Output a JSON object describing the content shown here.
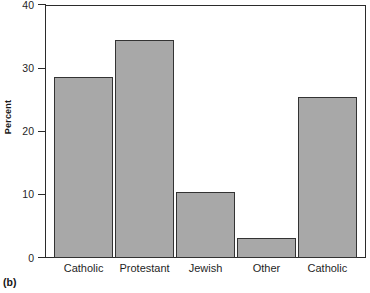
{
  "chart_data": {
    "type": "bar",
    "title": "",
    "subtitle": "",
    "xlabel": "",
    "ylabel": "Percent",
    "categories": [
      "Catholic",
      "Protestant",
      "Jewish",
      "Other",
      "Catholic"
    ],
    "values": [
      28.6,
      34.4,
      10.4,
      3.1,
      25.4
    ],
    "ylim": [
      0,
      40
    ],
    "yticks": [
      0,
      10,
      20,
      30,
      40
    ],
    "ytick_labels": [
      "0",
      "10",
      "20",
      "30",
      "40"
    ],
    "xticks": [],
    "grid": false,
    "legend": null,
    "legend_position": "none",
    "annotations": [
      "(b)"
    ],
    "series": [
      {
        "name": "Percent",
        "values": [
          28.6,
          34.4,
          10.4,
          3.1,
          25.4
        ]
      }
    ]
  },
  "figure": {
    "panel_label": "(b)",
    "axis": {
      "y_title": "Percent",
      "y_ticks": [
        {
          "label": "40",
          "value": 40
        },
        {
          "label": "30",
          "value": 30
        },
        {
          "label": "20",
          "value": 20
        },
        {
          "label": "10",
          "value": 10
        },
        {
          "label": "0",
          "value": 0
        }
      ]
    },
    "bars": [
      {
        "label": "Catholic",
        "value": 28.6
      },
      {
        "label": "Protestant",
        "value": 34.4
      },
      {
        "label": "Jewish",
        "value": 10.4
      },
      {
        "label": "Other",
        "value": 3.1
      },
      {
        "label": "Catholic",
        "value": 25.4
      }
    ]
  },
  "colors": {
    "bar_fill": "#a8a8a8",
    "bar_edge": "#333333",
    "frame": "#2b2b2b",
    "text": "#1f1f1f",
    "background": "#ffffff"
  }
}
